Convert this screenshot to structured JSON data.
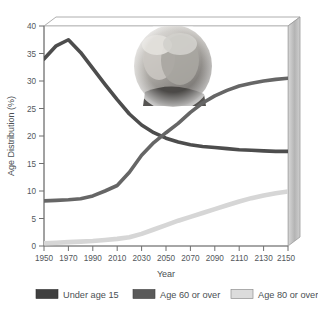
{
  "chart_data": {
    "type": "line",
    "title": "",
    "xlabel": "Year",
    "ylabel": "Age Distribution (%)",
    "xlim": [
      1950,
      2150
    ],
    "ylim": [
      0,
      40
    ],
    "xticks": [
      1950,
      1970,
      1990,
      2010,
      2030,
      2050,
      2070,
      2090,
      2110,
      2130,
      2150
    ],
    "yticks": [
      0,
      5,
      10,
      15,
      20,
      25,
      30,
      35,
      40
    ],
    "grid": false,
    "legend_position": "bottom",
    "x": [
      1950,
      1960,
      1970,
      1980,
      1990,
      2000,
      2010,
      2020,
      2030,
      2040,
      2050,
      2060,
      2070,
      2080,
      2090,
      2100,
      2110,
      2120,
      2130,
      2140,
      2150
    ],
    "series": [
      {
        "name": "Under age 15",
        "color": "#4d4d4d",
        "values": [
          34.0,
          36.4,
          37.5,
          35.2,
          32.3,
          29.4,
          26.6,
          24.0,
          22.0,
          20.6,
          19.6,
          18.9,
          18.4,
          18.1,
          17.9,
          17.7,
          17.5,
          17.4,
          17.3,
          17.2,
          17.2
        ]
      },
      {
        "name": "Age 60 or over",
        "color": "#666666",
        "values": [
          8.2,
          8.3,
          8.4,
          8.6,
          9.1,
          10.0,
          11.0,
          13.4,
          16.5,
          18.8,
          20.6,
          22.3,
          24.3,
          26.0,
          27.3,
          28.3,
          29.1,
          29.6,
          30.0,
          30.3,
          30.5
        ]
      },
      {
        "name": "Age 80 or over",
        "color": "#d6d6d6",
        "values": [
          0.5,
          0.6,
          0.7,
          0.8,
          0.9,
          1.1,
          1.3,
          1.6,
          2.2,
          3.0,
          3.8,
          4.6,
          5.3,
          6.0,
          6.7,
          7.4,
          8.1,
          8.7,
          9.2,
          9.6,
          9.9
        ]
      }
    ],
    "annotations": [
      {
        "name": "elderly-couple-photo",
        "description": "Grayscale photograph of an elderly couple"
      }
    ]
  },
  "axes": {
    "ylabel": "Age Distribution (%)",
    "xlabel": "Year",
    "ytick_labels": [
      "0",
      "5",
      "10",
      "15",
      "20",
      "25",
      "30",
      "35",
      "40"
    ],
    "xtick_labels": [
      "1950",
      "1970",
      "1990",
      "2010",
      "2030",
      "2050",
      "2070",
      "2090",
      "2110",
      "2130",
      "2150"
    ]
  },
  "legend": {
    "items": [
      {
        "label": "Under age 15",
        "color": "#3f3f3f"
      },
      {
        "label": "Age 60 or over",
        "color": "#5a5a5a"
      },
      {
        "label": "Age 80 or over",
        "color": "#dcdcdc"
      }
    ]
  },
  "colors": {
    "under15": "#4d4d4d",
    "over60": "#666666",
    "over80": "#d6d6d6",
    "axis": "#8a8a8a",
    "panel_side": "#bfbfbf",
    "panel_top": "#ffffff",
    "background": "#ffffff"
  }
}
